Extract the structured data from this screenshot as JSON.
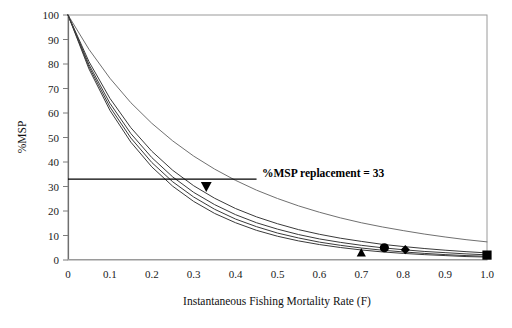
{
  "chart_data": {
    "type": "line",
    "title": "",
    "xlabel": "Instantaneous Fishing Mortality Rate (F)",
    "ylabel": "%MSP",
    "xlim": [
      0,
      1.0
    ],
    "ylim": [
      0,
      100
    ],
    "xticks": [
      0,
      0.1,
      0.2,
      0.3,
      0.4,
      0.5,
      0.6,
      0.7,
      0.8,
      0.9,
      1.0
    ],
    "xtick_labels": [
      "0",
      "0.1",
      "0.2",
      "0.3",
      "0.4",
      "0.5",
      "0.6",
      "0.7",
      "0.8",
      "0.9",
      "1.0"
    ],
    "yticks": [
      0,
      10,
      20,
      30,
      40,
      50,
      60,
      70,
      80,
      90,
      100
    ],
    "ytick_labels": [
      "0",
      "10",
      "20",
      "30",
      "40",
      "50",
      "60",
      "70",
      "80",
      "90",
      "100"
    ],
    "grid": false,
    "legend": "none",
    "x": [
      0,
      0.05,
      0.1,
      0.15,
      0.2,
      0.25,
      0.3,
      0.35,
      0.4,
      0.45,
      0.5,
      0.55,
      0.6,
      0.65,
      0.7,
      0.75,
      0.8,
      0.85,
      0.9,
      0.95,
      1.0
    ],
    "series": [
      {
        "name": "curve-upper",
        "values": [
          100,
          86.0,
          74.2,
          64.2,
          55.8,
          48.6,
          42.4,
          37.1,
          32.5,
          28.5,
          25.1,
          22.1,
          19.5,
          17.2,
          15.2,
          13.5,
          12.0,
          10.6,
          9.4,
          8.3,
          7.4
        ]
      },
      {
        "name": "curve-2",
        "values": [
          100,
          81.0,
          66.0,
          54.0,
          44.4,
          36.6,
          30.3,
          25.2,
          21.0,
          17.6,
          14.8,
          12.4,
          10.5,
          8.9,
          7.6,
          6.4,
          5.5,
          4.7,
          4.0,
          3.4,
          2.9
        ]
      },
      {
        "name": "curve-3",
        "values": [
          100,
          79.8,
          64.0,
          51.6,
          41.8,
          33.9,
          27.6,
          22.6,
          18.5,
          15.2,
          12.6,
          10.4,
          8.6,
          7.2,
          6.0,
          5.0,
          4.2,
          3.5,
          3.0,
          2.5,
          2.1
        ]
      },
      {
        "name": "curve-4",
        "values": [
          100,
          78.9,
          62.5,
          49.8,
          39.8,
          31.9,
          25.7,
          20.7,
          16.7,
          13.6,
          11.0,
          9.0,
          7.3,
          6.0,
          4.9,
          4.0,
          3.3,
          2.7,
          2.2,
          1.8,
          1.5
        ]
      },
      {
        "name": "curve-5",
        "values": [
          100,
          78.0,
          61.1,
          48.1,
          38.0,
          30.1,
          23.9,
          19.0,
          15.2,
          12.1,
          9.7,
          7.8,
          6.3,
          5.1,
          4.1,
          3.3,
          2.7,
          2.2,
          1.8,
          1.4,
          1.2
        ]
      }
    ],
    "reference_line": {
      "name": "msp-replacement-line",
      "label": "%MSP replacement = 33",
      "y": 33,
      "x_start": 0,
      "x_end": 0.45,
      "orientation": "horizontal"
    },
    "markers": [
      {
        "name": "marker-triangle-down",
        "shape": "triangle-down",
        "x": 0.33,
        "y": 30,
        "color": "#000000"
      },
      {
        "name": "marker-triangle-up",
        "shape": "triangle-up",
        "x": 0.7,
        "y": 3.0,
        "color": "#000000"
      },
      {
        "name": "marker-circle",
        "shape": "circle",
        "x": 0.755,
        "y": 5.0,
        "color": "#000000"
      },
      {
        "name": "marker-diamond",
        "shape": "diamond",
        "x": 0.805,
        "y": 4.2,
        "color": "#000000"
      },
      {
        "name": "marker-square",
        "shape": "square",
        "x": 1.0,
        "y": 2.0,
        "color": "#000000"
      }
    ],
    "colors": {
      "curve_dark": "#3a3a3a",
      "curve_light": "#707070",
      "axis": "#8a8a8a",
      "reference_line": "#000000",
      "marker": "#000000",
      "background": "#ffffff"
    }
  }
}
